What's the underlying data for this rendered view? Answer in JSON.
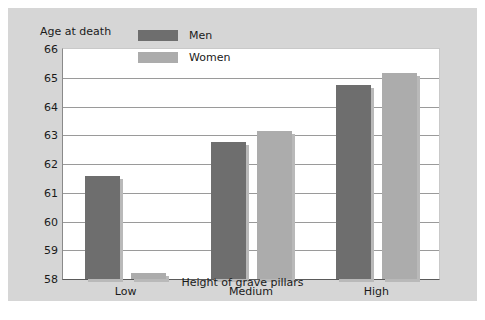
{
  "chart_data": {
    "type": "bar",
    "title": "",
    "xlabel": "Height of grave pillars",
    "ylabel": "Age at death",
    "categories": [
      "Low",
      "Medium",
      "High"
    ],
    "series": [
      {
        "name": "Men",
        "values": [
          61.6,
          62.75,
          64.75
        ],
        "color": "#6e6e6e"
      },
      {
        "name": "Women",
        "values": [
          58.2,
          63.15,
          65.15
        ],
        "color": "#acacac"
      }
    ],
    "ylim": [
      58,
      66
    ],
    "yticks": [
      58,
      59,
      60,
      61,
      62,
      63,
      64,
      65,
      66
    ],
    "ytick_labels": [
      "58",
      "59",
      "60",
      "61",
      "62",
      "63",
      "64",
      "65",
      "66"
    ],
    "grid": true,
    "legend_position": "top-left-inside",
    "legend_entries": [
      "Men",
      "Women"
    ]
  },
  "legend": {
    "men_label": "Men",
    "women_label": "Women"
  },
  "axes": {
    "y_title": "Age at death",
    "x_title": "Height of grave pillars"
  },
  "colors": {
    "men": "#6e6e6e",
    "women": "#acacac",
    "panel_background": "#d6d6d6",
    "plot_background": "#ffffff",
    "gridline": "#9a9a9a",
    "text": "#1a1a1a"
  }
}
